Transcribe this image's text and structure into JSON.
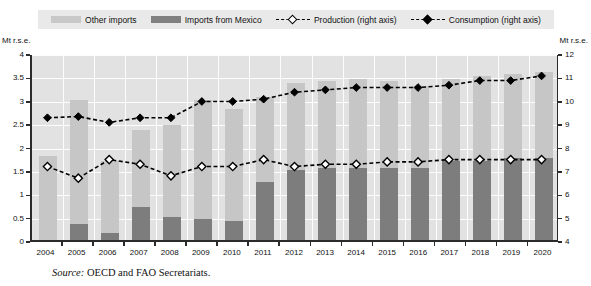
{
  "legend": {
    "items": [
      {
        "label": "Other imports",
        "kind": "swatch-light",
        "icon": "bar-swatch-light-icon"
      },
      {
        "label": "Imports from Mexico",
        "kind": "swatch-dark",
        "icon": "bar-swatch-dark-icon"
      },
      {
        "label": "Production (right axis)",
        "kind": "line-open",
        "icon": "dashed-line-open-diamond-icon"
      },
      {
        "label": "Consumption  (right axis)",
        "kind": "line-filled",
        "icon": "dashed-line-filled-diamond-icon"
      }
    ]
  },
  "axes": {
    "left_caption": "Mt r.s.e.",
    "right_caption": "Mt r.s.e.",
    "left_ticks": [
      "0",
      "0.5",
      "1",
      "1.5",
      "2",
      "2.5",
      "3",
      "3.5",
      "4"
    ],
    "right_ticks": [
      "4",
      "5",
      "6",
      "7",
      "8",
      "9",
      "10",
      "11",
      "12"
    ]
  },
  "source": {
    "prefix": "Source:",
    "text": "OECD and FAO Secretariats."
  },
  "colors": {
    "other_imports": "#c6c6c6",
    "imports_mexico": "#7d7d7d",
    "plot_background": "#e2e2e2",
    "gridline": "#fdfdfd",
    "line": "#000000",
    "legend_background": "#e9e9e9"
  },
  "chart_data": {
    "type": "bar",
    "title": "",
    "subtitle": "",
    "xlabel": "",
    "ylabel": "Mt r.s.e.",
    "y2label": "Mt r.s.e.",
    "ylim": [
      0,
      4
    ],
    "y2lim": [
      4,
      12
    ],
    "ytick_step": 0.5,
    "y2tick_step": 1,
    "grid": true,
    "legend_position": "top",
    "stacked": true,
    "categories": [
      "2004",
      "2005",
      "2006",
      "2007",
      "2008",
      "2009",
      "2010",
      "2011",
      "2012",
      "2013",
      "2014",
      "2015",
      "2016",
      "2017",
      "2018",
      "2019",
      "2020"
    ],
    "series": [
      {
        "name": "Other imports",
        "axis": "left",
        "type": "bar",
        "stack": "imports",
        "values": [
          1.8,
          2.65,
          1.55,
          1.65,
          1.95,
          2.55,
          2.4,
          1.8,
          1.85,
          1.85,
          1.9,
          1.85,
          1.75,
          1.75,
          1.8,
          1.8,
          1.85
        ]
      },
      {
        "name": "Imports from Mexico",
        "axis": "left",
        "type": "bar",
        "stack": "imports",
        "values": [
          0.0,
          0.35,
          0.15,
          0.7,
          0.5,
          0.45,
          0.4,
          1.25,
          1.5,
          1.55,
          1.55,
          1.55,
          1.55,
          1.7,
          1.7,
          1.75,
          1.75
        ]
      },
      {
        "name": "Production (right axis)",
        "axis": "right",
        "type": "line",
        "marker": "open-diamond",
        "linestyle": "dashed",
        "values": [
          7.2,
          6.7,
          7.5,
          7.3,
          6.8,
          7.2,
          7.2,
          7.5,
          7.2,
          7.3,
          7.3,
          7.4,
          7.4,
          7.5,
          7.5,
          7.5,
          7.5
        ]
      },
      {
        "name": "Consumption  (right axis)",
        "axis": "right",
        "type": "line",
        "marker": "filled-diamond",
        "linestyle": "dashed",
        "values": [
          9.3,
          9.35,
          9.1,
          9.3,
          9.3,
          10.0,
          10.0,
          10.1,
          10.4,
          10.5,
          10.6,
          10.6,
          10.6,
          10.7,
          10.9,
          10.9,
          11.1
        ]
      }
    ]
  }
}
